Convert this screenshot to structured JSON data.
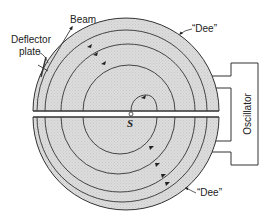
{
  "figure": {
    "labels": {
      "beam": "Beam",
      "deflector_line1": "Deflector",
      "deflector_line2": "plate",
      "dee_top": "“Dee”",
      "dee_bottom": "“Dee”",
      "source": "S",
      "oscillator": "Oscillator"
    },
    "colors": {
      "dee_fill": "#d9d9d9",
      "stroke": "#333333",
      "background": "#ffffff"
    },
    "components": [
      {
        "name": "upper-dee",
        "type": "half-disc"
      },
      {
        "name": "lower-dee",
        "type": "half-disc"
      },
      {
        "name": "gap",
        "type": "slit"
      },
      {
        "name": "ion-source",
        "type": "point",
        "label": "S"
      },
      {
        "name": "spiral-beam-path",
        "type": "spiral",
        "turns": 5
      },
      {
        "name": "deflector-plate",
        "type": "plate"
      },
      {
        "name": "oscillator",
        "type": "box",
        "label": "Oscillator"
      }
    ]
  }
}
